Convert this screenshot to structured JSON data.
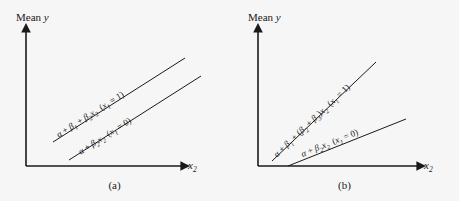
{
  "figure": {
    "background_color": "#f6f6f6",
    "line_color": "#1a1a1a"
  },
  "panels": [
    {
      "id": "a",
      "caption": "(a)",
      "y_axis_label_prefix": "Mean ",
      "y_axis_label_var": "y",
      "x_axis_label_base": "x",
      "x_axis_label_sub": "2",
      "description": "Two parallel lines, equal slopes, different intercepts",
      "lines": [
        {
          "id": "upper",
          "label_parts": {
            "alpha": "α",
            "plus1": " + ",
            "beta1": "β",
            "beta1_sub": "1",
            "plus2": " + ",
            "beta2": "β",
            "beta2_sub": "2",
            "x_var": "x",
            "x_sub": "2",
            "condition_open": "(",
            "condition_var": "x",
            "condition_sub": "1",
            "condition_rest": " = 1)"
          },
          "label_text": "α + β1 + β2x2 (x1 = 1)"
        },
        {
          "id": "lower",
          "label_parts": {
            "alpha": "α",
            "plus1": " + ",
            "beta2": "β",
            "beta2_sub": "2",
            "x_var": "x",
            "x_sub": "2",
            "condition_open": "(",
            "condition_var": "x",
            "condition_sub": "1",
            "condition_rest": " = 0)"
          },
          "label_text": "α + β2x2 (x1 = 0)"
        }
      ]
    },
    {
      "id": "b",
      "caption": "(b)",
      "y_axis_label_prefix": "Mean ",
      "y_axis_label_var": "y",
      "x_axis_label_base": "x",
      "x_axis_label_sub": "2",
      "description": "Two lines with different slopes diverging from near the origin",
      "lines": [
        {
          "id": "upper",
          "label_parts": {
            "alpha": "α",
            "plus1": " + ",
            "beta1": "β",
            "beta1_sub": "1",
            "plus2": " + (",
            "beta2": "β",
            "beta2_sub": "2",
            "plus3": " + ",
            "beta3": "β",
            "beta3_sub": "3",
            "close": ")",
            "x_var": "x",
            "x_sub": "2",
            "condition_open": "(",
            "condition_var": "x",
            "condition_sub": "1",
            "condition_rest": " = 1)"
          },
          "label_text": "α + β1 + (β2 + β3)x2 (x1 = 1)"
        },
        {
          "id": "lower",
          "label_parts": {
            "alpha": "α",
            "plus1": " + ",
            "beta2": "β",
            "beta2_sub": "2",
            "x_var": "x",
            "x_sub": "2",
            "condition_open": "(",
            "condition_var": "x",
            "condition_sub": "1",
            "condition_rest": " = 0)"
          },
          "label_text": "α + β2x2 (x1 = 0)"
        }
      ]
    }
  ]
}
